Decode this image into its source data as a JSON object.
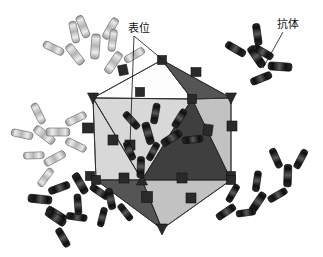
{
  "figure": {
    "name": "antibody-icosahedral-capsid-diagram",
    "background_color": "#ffffff",
    "width": 323,
    "height": 257
  },
  "labels": [
    {
      "id": "epitope",
      "text": "表位",
      "x": 128,
      "y": 32,
      "anchor": "start",
      "leader_targets": [
        [
          163,
          60
        ],
        [
          130,
          145
        ]
      ]
    },
    {
      "id": "antibody",
      "text": "抗体",
      "x": 277,
      "y": 28,
      "anchor": "start",
      "leader_targets": [
        [
          263,
          68
        ]
      ]
    }
  ],
  "colors": {
    "facet_white": "#fdfdfd",
    "facet_light": "#d8d8d8",
    "facet_mid": "#c2c2c2",
    "facet_dark": "#555555",
    "facet_darker": "#3f3f3f",
    "epitope_block": "#2a2a2a",
    "epitope_block_edge": "#111111",
    "antibody_dark": "#1c1c1c",
    "antibody_dark_mid": "#4a4a4a",
    "antibody_light": "#b9b9b9",
    "antibody_light_mid": "#dcdcdc",
    "outline": "#2a2a2a",
    "leader_line": "#111111",
    "text": "#111111"
  },
  "capsid": {
    "name": "icosahedral-viral-capsid",
    "vertices": {
      "top": [
        162,
        60
      ],
      "upper_left": [
        93,
        98
      ],
      "upper_right": [
        192,
        99
      ],
      "right": [
        231,
        98
      ],
      "left_mid": [
        96,
        180
      ],
      "center_low": [
        142,
        180
      ],
      "right_low": [
        231,
        180
      ],
      "bottom": [
        162,
        229
      ]
    },
    "facets": [
      {
        "id": "f-top-left",
        "shade": "facet_white",
        "points": "93,98 162,60 192,99"
      },
      {
        "id": "f-top-right",
        "shade": "facet_dark",
        "points": "162,60 231,98 192,99"
      },
      {
        "id": "f-mid-left",
        "shade": "facet_light",
        "points": "93,98 192,99 142,180"
      },
      {
        "id": "f-mid-left2",
        "shade": "facet_light",
        "points": "93,98 142,180 96,180"
      },
      {
        "id": "f-mid-right",
        "shade": "facet_mid",
        "points": "192,99 231,98 231,180"
      },
      {
        "id": "f-mid-right2",
        "shade": "facet_darker",
        "points": "192,99 231,180 142,180"
      },
      {
        "id": "f-low-left",
        "shade": "facet_dark",
        "points": "96,180 142,180 162,229"
      },
      {
        "id": "f-low-right",
        "shade": "facet_mid",
        "points": "142,180 231,180 162,229"
      }
    ],
    "edges": [
      "93,98 162,60",
      "162,60 192,99",
      "162,60 231,98",
      "93,98 192,99",
      "192,99 231,98",
      "93,98 142,180",
      "192,99 142,180",
      "231,98 231,180",
      "192,99 231,180",
      "93,98 96,180",
      "96,180 142,180",
      "142,180 231,180",
      "96,180 162,229",
      "142,180 162,229",
      "231,180 162,229"
    ],
    "vertex_markers": [
      {
        "id": "vtx-top",
        "x": 162,
        "y": 60,
        "type": "square"
      },
      {
        "id": "vtx-upper-left",
        "x": 93,
        "y": 98,
        "type": "triangle-down"
      },
      {
        "id": "vtx-upper-right",
        "x": 192,
        "y": 99,
        "type": "square"
      },
      {
        "id": "vtx-right",
        "x": 231,
        "y": 98,
        "type": "triangle-down"
      },
      {
        "id": "vtx-left-mid",
        "x": 96,
        "y": 180,
        "type": "square"
      },
      {
        "id": "vtx-center-low",
        "x": 142,
        "y": 180,
        "type": "triangle-up"
      },
      {
        "id": "vtx-right-low",
        "x": 231,
        "y": 180,
        "type": "square"
      },
      {
        "id": "vtx-bottom",
        "x": 162,
        "y": 229,
        "type": "triangle-down"
      }
    ],
    "epitope_blocks": [
      {
        "id": "ep-1",
        "x": 140,
        "y": 92,
        "w": 9,
        "h": 9,
        "rot": 0
      },
      {
        "id": "ep-2",
        "x": 196,
        "y": 72,
        "w": 10,
        "h": 9,
        "rot": 0
      },
      {
        "id": "ep-3",
        "x": 123,
        "y": 70,
        "w": 9,
        "h": 10,
        "rot": -12
      },
      {
        "id": "ep-4",
        "x": 113,
        "y": 140,
        "w": 10,
        "h": 10,
        "rot": 0
      },
      {
        "id": "ep-5",
        "x": 88,
        "y": 128,
        "w": 11,
        "h": 10,
        "rot": 0
      },
      {
        "id": "ep-6",
        "x": 208,
        "y": 130,
        "w": 9,
        "h": 11,
        "rot": 8
      },
      {
        "id": "ep-7",
        "x": 232,
        "y": 126,
        "w": 10,
        "h": 10,
        "rot": 0
      },
      {
        "id": "ep-8",
        "x": 130,
        "y": 145,
        "w": 10,
        "h": 10,
        "rot": 0
      },
      {
        "id": "ep-9",
        "x": 124,
        "y": 178,
        "w": 10,
        "h": 10,
        "rot": 0
      },
      {
        "id": "ep-10",
        "x": 182,
        "y": 178,
        "w": 10,
        "h": 10,
        "rot": 0
      },
      {
        "id": "ep-11",
        "x": 147,
        "y": 197,
        "w": 11,
        "h": 11,
        "rot": 0
      },
      {
        "id": "ep-12",
        "x": 191,
        "y": 198,
        "w": 10,
        "h": 10,
        "rot": 0
      },
      {
        "id": "ep-13",
        "x": 231,
        "y": 176,
        "w": 9,
        "h": 9,
        "rot": 0
      },
      {
        "id": "ep-14",
        "x": 90,
        "y": 176,
        "w": 9,
        "h": 9,
        "rot": 0
      }
    ]
  },
  "antibodies": [
    {
      "id": "ab-tl-1",
      "x": 96,
      "y": 38,
      "rot": 4,
      "scale": 1.0,
      "tone": "light"
    },
    {
      "id": "ab-tl-2",
      "x": 70,
      "y": 48,
      "rot": -38,
      "scale": 0.95,
      "tone": "light"
    },
    {
      "id": "ab-tl-3",
      "x": 118,
      "y": 56,
      "rot": 34,
      "scale": 0.95,
      "tone": "light"
    },
    {
      "id": "ab-l-1",
      "x": 38,
      "y": 130,
      "rot": -52,
      "scale": 0.95,
      "tone": "light"
    },
    {
      "id": "ab-l-2",
      "x": 66,
      "y": 132,
      "rot": 90,
      "scale": 0.95,
      "tone": "light"
    },
    {
      "id": "ab-l-3",
      "x": 48,
      "y": 162,
      "rot": -118,
      "scale": 0.9,
      "tone": "light"
    },
    {
      "id": "ab-bl-1",
      "x": 48,
      "y": 200,
      "rot": 96,
      "scale": 0.95,
      "tone": "dark"
    },
    {
      "id": "ab-bl-2",
      "x": 62,
      "y": 222,
      "rot": 124,
      "scale": 0.9,
      "tone": "dark"
    },
    {
      "id": "ab-bl-3",
      "x": 84,
      "y": 190,
      "rot": 150,
      "scale": 0.9,
      "tone": "dark"
    },
    {
      "id": "ab-b-1",
      "x": 112,
      "y": 206,
      "rot": 168,
      "scale": 0.85,
      "tone": "dark"
    },
    {
      "id": "ab-tr-1",
      "x": 252,
      "y": 50,
      "rot": -34,
      "scale": 0.95,
      "tone": "dark"
    },
    {
      "id": "ab-tr-2",
      "x": 272,
      "y": 66,
      "rot": -86,
      "scale": 0.95,
      "tone": "dark"
    },
    {
      "id": "ab-r-1",
      "x": 288,
      "y": 168,
      "rot": 2,
      "scale": 0.9,
      "tone": "dark"
    },
    {
      "id": "ab-br-1",
      "x": 262,
      "y": 196,
      "rot": 34,
      "scale": 0.9,
      "tone": "dark"
    },
    {
      "id": "ab-br-2",
      "x": 232,
      "y": 208,
      "rot": 56,
      "scale": 0.85,
      "tone": "dark"
    },
    {
      "id": "ab-c-1",
      "x": 146,
      "y": 126,
      "rot": -16,
      "scale": 0.9,
      "tone": "dark"
    },
    {
      "id": "ab-c-2",
      "x": 178,
      "y": 134,
      "rot": 58,
      "scale": 0.9,
      "tone": "dark"
    },
    {
      "id": "ab-c-3",
      "x": 141,
      "y": 160,
      "rot": 2,
      "scale": 0.85,
      "tone": "dark"
    }
  ]
}
